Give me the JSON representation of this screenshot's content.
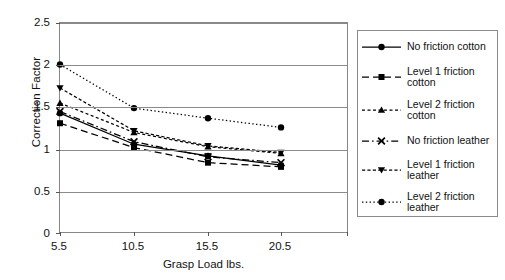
{
  "chart_data": {
    "type": "line",
    "title": "",
    "xlabel": "Grasp Load lbs.",
    "ylabel": "Correction Factor",
    "x": [
      5.5,
      10.5,
      15.5,
      20.5
    ],
    "categories": [
      "5.5",
      "10.5",
      "15.5",
      "20.5"
    ],
    "xticklabels": [
      "5.5",
      "10.5",
      "15.5",
      "20.5"
    ],
    "yticklabels": [
      "0",
      "0.5",
      "1",
      "1.5",
      "2",
      "2.5"
    ],
    "ytickvalues": [
      0,
      0.5,
      1,
      1.5,
      2,
      2.5
    ],
    "ylim": [
      0,
      2.5
    ],
    "grid": "horizontal",
    "legend_position": "right",
    "series": [
      {
        "name": "No friction cotton",
        "marker": "circle",
        "linestyle": "solid",
        "values": [
          1.44,
          1.07,
          0.93,
          0.82
        ]
      },
      {
        "name": "Level 1 friction cotton",
        "marker": "square",
        "linestyle": "dashed",
        "values": [
          1.32,
          1.03,
          0.85,
          0.8
        ]
      },
      {
        "name": "Level 2 friction cotton",
        "marker": "triangle-up",
        "linestyle": "dashed-short",
        "values": [
          1.56,
          1.21,
          1.04,
          0.96
        ]
      },
      {
        "name": "No friction leather",
        "marker": "cross",
        "linestyle": "dash-dot",
        "values": [
          1.46,
          1.1,
          0.92,
          0.85
        ]
      },
      {
        "name": "Level 1 friction leather",
        "marker": "triangle-down",
        "linestyle": "dashed-fine",
        "values": [
          1.74,
          1.23,
          1.05,
          0.97
        ]
      },
      {
        "name": "Level 2 friction leather",
        "marker": "circle",
        "linestyle": "dotted",
        "values": [
          2.02,
          1.5,
          1.38,
          1.27
        ]
      }
    ],
    "colors": {
      "ink": "#000000",
      "axis": "#8a8a8a",
      "grid": "#8a8a8a",
      "background": "#ffffff"
    }
  },
  "legend": {
    "items": [
      {
        "label": "No friction cotton"
      },
      {
        "label": "Level 1 friction\ncotton"
      },
      {
        "label": "Level 2 friction\ncotton"
      },
      {
        "label": "No friction leather"
      },
      {
        "label": "Level 1 friction\nleather"
      },
      {
        "label": "Level 2 friction\nleather"
      }
    ]
  }
}
